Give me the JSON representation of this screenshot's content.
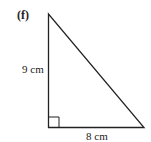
{
  "figure": {
    "label": "(f)",
    "shape": "right-triangle",
    "sides": {
      "vertical": "9 cm",
      "horizontal": "8 cm"
    },
    "right_angle_marker": true,
    "stroke_color": "#222222"
  }
}
